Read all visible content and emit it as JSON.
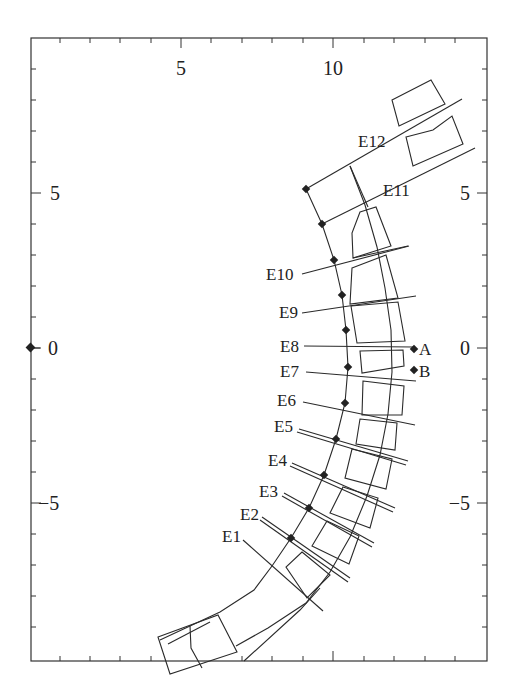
{
  "figure": {
    "type": "diagram",
    "x_axis": {
      "ticks": [
        {
          "label": "5",
          "px": 181
        },
        {
          "label": "10",
          "px": 333
        }
      ]
    },
    "y_axis_left": {
      "ticks": [
        {
          "label": "5",
          "py": 193
        },
        {
          "label": "0",
          "py": 348
        },
        {
          "label": "−5",
          "py": 503
        }
      ]
    },
    "y_axis_right": {
      "ticks": [
        {
          "label": "5",
          "py": 193
        },
        {
          "label": "0",
          "py": 348
        },
        {
          "label": "−5",
          "py": 503
        }
      ]
    },
    "element_labels": [
      {
        "id": "E12",
        "label": "E12"
      },
      {
        "id": "E11",
        "label": "E11"
      },
      {
        "id": "E10",
        "label": "E10"
      },
      {
        "id": "E9",
        "label": "E9"
      },
      {
        "id": "E8",
        "label": "E8"
      },
      {
        "id": "E7",
        "label": "E7"
      },
      {
        "id": "E6",
        "label": "E6"
      },
      {
        "id": "E5",
        "label": "E5"
      },
      {
        "id": "E4",
        "label": "E4"
      },
      {
        "id": "E3",
        "label": "E3"
      },
      {
        "id": "E2",
        "label": "E2"
      },
      {
        "id": "E1",
        "label": "E1"
      }
    ],
    "points": [
      {
        "id": "A",
        "label": "A"
      },
      {
        "id": "B",
        "label": "B"
      }
    ],
    "origin_marker": {
      "label": "0"
    }
  }
}
